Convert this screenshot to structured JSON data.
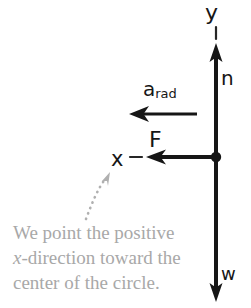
{
  "figure": {
    "type": "free-body-diagram",
    "background_color": "#ffffff",
    "ink_color": "#161616",
    "caption_color": "#a8a8a8"
  },
  "axes": {
    "y_label": "y",
    "x_label": "x",
    "y_axis_orientation": "vertical",
    "x_axis_orientation": "horizontal-left"
  },
  "vectors": [
    {
      "name": "normal-force",
      "label": "n",
      "direction": "up",
      "tail": [
        216,
        157
      ],
      "head": [
        216,
        46
      ]
    },
    {
      "name": "weight",
      "label": "w",
      "direction": "down",
      "tail": [
        216,
        157
      ],
      "head": [
        216,
        300
      ]
    },
    {
      "name": "net-force",
      "label": "F",
      "direction": "left",
      "tail": [
        216,
        157
      ],
      "head": [
        148,
        157
      ]
    },
    {
      "name": "radial-acceleration",
      "label": "a",
      "label_subscript": "rad",
      "direction": "left",
      "tail": [
        197,
        114
      ],
      "head": [
        131,
        114
      ]
    }
  ],
  "origin_point": {
    "name": "origin-dot",
    "position": [
      216,
      157
    ]
  },
  "caption": {
    "line1": "We point the positive",
    "line2_italic": "x",
    "line2_rest": "-direction toward the",
    "line3": "center of the circle.",
    "pointer": "dotted-curved-arrow-to-x-axis-label"
  }
}
